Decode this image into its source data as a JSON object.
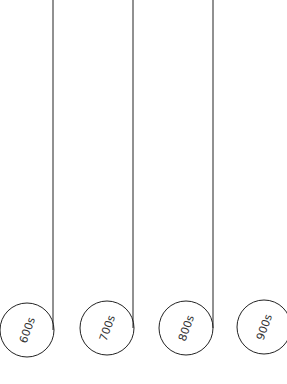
{
  "diagram": {
    "type": "timeline-tags",
    "nodes": [
      {
        "label": "600s",
        "cx": 27,
        "cy": 330,
        "has_line": true,
        "line_x": 53
      },
      {
        "label": "700s",
        "cx": 107,
        "cy": 328,
        "has_line": true,
        "line_x": 133
      },
      {
        "label": "800s",
        "cx": 186,
        "cy": 328,
        "has_line": true,
        "line_x": 213
      },
      {
        "label": "900s",
        "cx": 264,
        "cy": 328,
        "has_line": false
      }
    ],
    "colors": {
      "stroke": "#222222",
      "text": "#333333",
      "background": "#ffffff"
    }
  }
}
